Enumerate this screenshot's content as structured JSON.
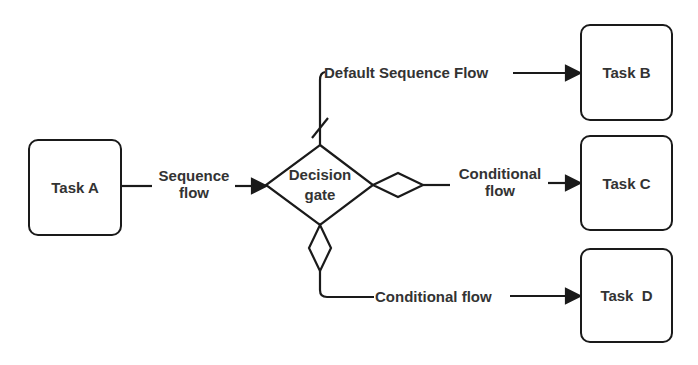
{
  "diagram": {
    "type": "BPMN gateway flow",
    "colors": {
      "stroke": "#1a1a1a",
      "text": "#333333",
      "background": "#ffffff"
    },
    "nodes": {
      "task_a": {
        "label": "Task A"
      },
      "gateway": {
        "label_line1": "Decision",
        "label_line2": "gate"
      },
      "task_b": {
        "label": "Task B"
      },
      "task_c": {
        "label": "Task C"
      },
      "task_d": {
        "label": "Task  D"
      }
    },
    "edges": {
      "a_to_gate": {
        "label_line1": "Sequence",
        "label_line2": "flow"
      },
      "gate_to_b": {
        "label": "Default Sequence Flow",
        "marker": "default-slash"
      },
      "gate_to_c": {
        "label_line1": "Conditional",
        "label_line2": "flow",
        "marker": "conditional-diamond"
      },
      "gate_to_d": {
        "label": "Conditional flow",
        "marker": "conditional-diamond"
      }
    }
  }
}
